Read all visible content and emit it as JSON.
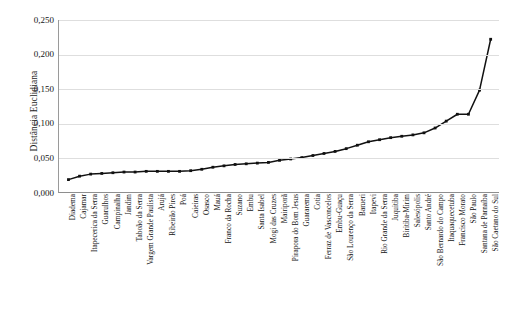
{
  "chart_data": {
    "type": "line",
    "title": "",
    "xlabel": "",
    "ylabel": "Distância Euclidiana",
    "ylim": [
      0.0,
      0.25
    ],
    "yticks": [
      0.0,
      0.05,
      0.1,
      0.15,
      0.2,
      0.25
    ],
    "ytick_labels": [
      "0,000",
      "0,050",
      "0,100",
      "0,150",
      "0,200",
      "0,250"
    ],
    "grid": true,
    "legend": "none",
    "marker": "square",
    "line_color": "#111111",
    "categories": [
      "Diadema",
      "Cajamar",
      "Itapecerica da Serra",
      "Guarulhos",
      "Campinalha",
      "Jandim",
      "Taboão da Serra",
      "Vargem Grande Paulista",
      "Arujá",
      "Ribeirão Pires",
      "Poá",
      "Caieiras",
      "Osasco",
      "Mauá",
      "Franco da Rocha",
      "Suzano",
      "Embu",
      "Santa Isabel",
      "Mogi das Cruzes",
      "Mairiporã",
      "Pirapora do Bom Jesus",
      "Guararema",
      "Cotia",
      "Ferraz de Vasconcelos",
      "Embu-Guaçu",
      "São Lourenço da Serra",
      "Barueri",
      "Itapevi",
      "Rio Grande da Serra",
      "Juquitiba",
      "Biritiba-Mirim",
      "Salesópolis",
      "Santo André",
      "São Bernardo do Campo",
      "Itaquaquecetuba",
      "Francisco Morato",
      "São Paulo",
      "Santana de Parnaíba",
      "São Caetano do Sul"
    ],
    "values": [
      0.018,
      0.023,
      0.026,
      0.027,
      0.028,
      0.029,
      0.029,
      0.03,
      0.03,
      0.03,
      0.03,
      0.031,
      0.033,
      0.036,
      0.038,
      0.04,
      0.041,
      0.042,
      0.043,
      0.046,
      0.048,
      0.05,
      0.053,
      0.056,
      0.059,
      0.063,
      0.068,
      0.073,
      0.076,
      0.079,
      0.081,
      0.083,
      0.086,
      0.093,
      0.103,
      0.113,
      0.113,
      0.148,
      0.222
    ]
  }
}
